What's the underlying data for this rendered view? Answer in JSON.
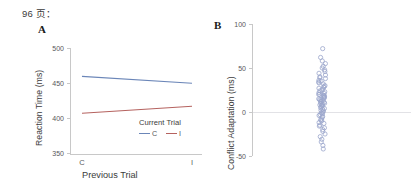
{
  "page_reference": "96 页：",
  "figure": {
    "panel_a": {
      "label": "A",
      "ylabel": "Reaction Time (ms)",
      "xlabel": "Previous Trial",
      "legend_title": "Current Trial"
    },
    "panel_b": {
      "label": "B",
      "ylabel": "Conflict Adaptation (ms)"
    }
  },
  "chart_data": [
    {
      "type": "line",
      "title": "A",
      "xlabel": "Previous Trial",
      "ylabel": "Reaction Time (ms)",
      "categories": [
        "C",
        "I"
      ],
      "xticklabels": [
        "C",
        "I"
      ],
      "yticklabels": [
        "500",
        "450",
        "400",
        "350"
      ],
      "yticks": [
        500,
        450,
        400,
        350
      ],
      "ylim": [
        350,
        500
      ],
      "grid": false,
      "legend_title": "Current Trial",
      "legend_position": "inside-bottom-right",
      "series": [
        {
          "name": "C",
          "values": [
            460,
            450
          ],
          "color": "#6b86b8"
        },
        {
          "name": "I",
          "values": [
            408,
            418
          ],
          "color": "#b5625f"
        }
      ]
    },
    {
      "type": "scatter",
      "title": "B",
      "xlabel": "",
      "ylabel": "Conflict Adaptation (ms)",
      "yticklabels": [
        "100",
        "50",
        "0",
        "-50"
      ],
      "yticks": [
        100,
        50,
        0,
        -50
      ],
      "ylim": [
        -50,
        100
      ],
      "grid": false,
      "zero_line": true,
      "marker": "open-circle",
      "marker_color": "#9aa6cc",
      "x": [
        0.5
      ],
      "values": [
        72,
        62,
        58,
        55,
        52,
        50,
        48,
        46,
        44,
        42,
        40,
        39,
        38,
        36,
        35,
        34,
        33,
        32,
        30,
        29,
        28,
        27,
        26,
        25,
        24,
        23,
        22,
        21,
        20,
        20,
        19,
        18,
        18,
        17,
        16,
        16,
        15,
        14,
        14,
        13,
        12,
        12,
        11,
        10,
        10,
        9,
        8,
        8,
        7,
        6,
        5,
        4,
        3,
        2,
        1,
        0,
        -1,
        -2,
        -3,
        -4,
        -5,
        -6,
        -8,
        -9,
        -10,
        -12,
        -13,
        -15,
        -16,
        -18,
        -20,
        -22,
        -25,
        -28,
        -31,
        -34,
        -38,
        -42
      ]
    }
  ]
}
